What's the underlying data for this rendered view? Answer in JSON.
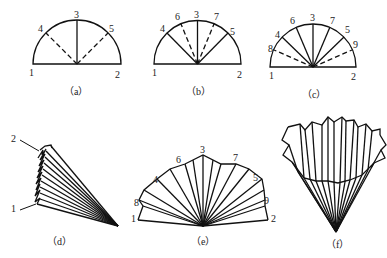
{
  "figure": {
    "panels": [
      {
        "id": "a",
        "caption": "（a）",
        "points": [
          "1",
          "2",
          "3",
          "4",
          "5"
        ]
      },
      {
        "id": "b",
        "caption": "（b）",
        "points": [
          "1",
          "2",
          "3",
          "4",
          "5",
          "6",
          "7"
        ]
      },
      {
        "id": "c",
        "caption": "（c）",
        "points": [
          "1",
          "2",
          "3",
          "4",
          "5",
          "6",
          "7",
          "8",
          "9"
        ]
      },
      {
        "id": "d",
        "caption": "（d）",
        "points": [
          "1",
          "2"
        ]
      },
      {
        "id": "e",
        "caption": "（e）",
        "points": [
          "1",
          "2",
          "3",
          "4",
          "5",
          "6",
          "7",
          "8",
          "9"
        ]
      },
      {
        "id": "f",
        "caption": "（f）",
        "points": []
      }
    ],
    "colors": {
      "stroke": "#111111",
      "background": "#ffffff"
    }
  }
}
